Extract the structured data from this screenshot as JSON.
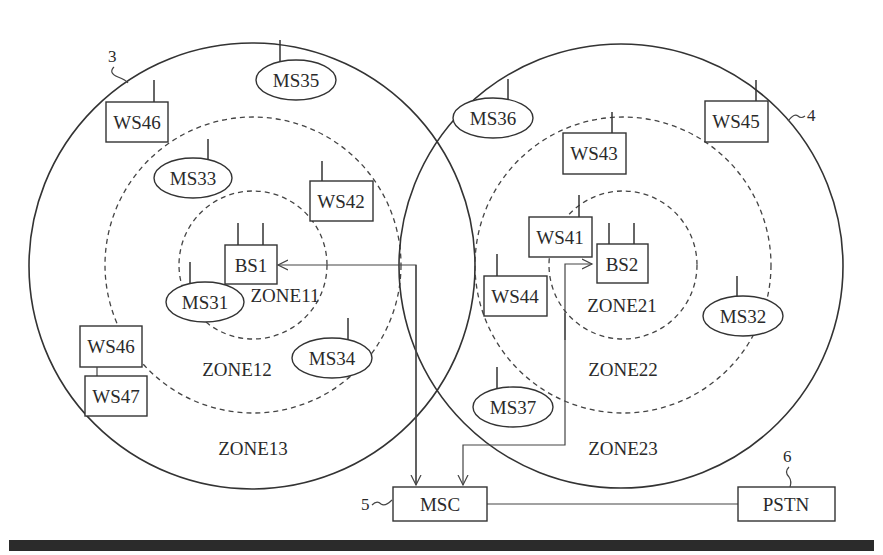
{
  "figure": {
    "type": "cellular network zone diagram",
    "cells": [
      {
        "ref": "3",
        "zones": [
          "ZONE11",
          "ZONE12",
          "ZONE13"
        ],
        "base_station": "BS1"
      },
      {
        "ref": "4",
        "zones": [
          "ZONE21",
          "ZONE22",
          "ZONE23"
        ],
        "base_station": "BS2"
      }
    ],
    "base_stations": [
      {
        "id": "BS1",
        "label": "BS1"
      },
      {
        "id": "BS2",
        "label": "BS2"
      }
    ],
    "mobile_stations": [
      {
        "label": "MS31"
      },
      {
        "label": "MS32"
      },
      {
        "label": "MS33"
      },
      {
        "label": "MS34"
      },
      {
        "label": "MS35"
      },
      {
        "label": "MS36"
      },
      {
        "label": "MS37"
      }
    ],
    "wireless_stations": [
      {
        "label": "WS41"
      },
      {
        "label": "WS42"
      },
      {
        "label": "WS43"
      },
      {
        "label": "WS44"
      },
      {
        "label": "WS45"
      },
      {
        "label": "WS46"
      },
      {
        "label": "WS46"
      },
      {
        "label": "WS47"
      }
    ],
    "zone_labels": {
      "z11": "ZONE11",
      "z12": "ZONE12",
      "z13": "ZONE13",
      "z21": "ZONE21",
      "z22": "ZONE22",
      "z23": "ZONE23"
    },
    "msc": {
      "label": "MSC",
      "ref": "5"
    },
    "pstn": {
      "label": "PSTN",
      "ref": "6"
    },
    "refs": {
      "cell1": "3",
      "cell2": "4"
    }
  },
  "labels": {
    "bs1": "BS1",
    "bs2": "BS2",
    "ms31": "MS31",
    "ms32": "MS32",
    "ms33": "MS33",
    "ms34": "MS34",
    "ms35": "MS35",
    "ms36": "MS36",
    "ms37": "MS37",
    "ws41": "WS41",
    "ws42": "WS42",
    "ws43": "WS43",
    "ws44": "WS44",
    "ws45": "WS45",
    "ws46_top": "WS46",
    "ws46_left": "WS46",
    "ws47": "WS47",
    "zone11": "ZONE11",
    "zone12": "ZONE12",
    "zone13": "ZONE13",
    "zone21": "ZONE21",
    "zone22": "ZONE22",
    "zone23": "ZONE23",
    "msc": "MSC",
    "pstn": "PSTN",
    "ref3": "3",
    "ref4": "4",
    "ref5": "5",
    "ref6": "6"
  },
  "colors": {
    "ink": "#333333",
    "background": "#ffffff",
    "bottom_bar": "#2b2b2b"
  }
}
